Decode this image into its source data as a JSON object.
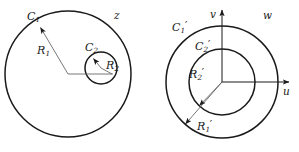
{
  "figure": {
    "type": "conformal-mapping-diagram",
    "stroke_color": "#1a1a1a",
    "background_color": "#ffffff",
    "width": 299,
    "height": 152
  },
  "left_panel": {
    "name": "z-plane",
    "plane_label": "z",
    "outer_circle": {
      "label": "C",
      "label_sub": "1",
      "radius_label": "R",
      "radius_sub": "1",
      "cx": 68,
      "cy": 74,
      "r": 63
    },
    "inner_circle": {
      "label": "C",
      "label_sub": "2",
      "radius_label": "R",
      "radius_sub": "2",
      "cx": 101,
      "cy": 68,
      "r": 16
    }
  },
  "right_panel": {
    "name": "w-plane",
    "plane_label": "w",
    "axes": {
      "horizontal_label": "u",
      "vertical_label": "v"
    },
    "outer_circle": {
      "label": "C",
      "label_sub": "1",
      "prime": "′",
      "radius_label": "R",
      "radius_sub": "1",
      "radius_prime": "′",
      "cx": 222,
      "cy": 82,
      "r": 56
    },
    "inner_circle": {
      "label": "C",
      "label_sub": "2",
      "prime": "′",
      "radius_label": "R",
      "radius_sub": "2",
      "radius_prime": "′",
      "cx": 222,
      "cy": 82,
      "r": 33
    }
  }
}
